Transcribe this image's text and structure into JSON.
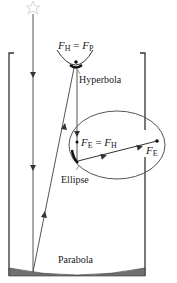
{
  "diagram": {
    "type": "Cassegrain-type telescope optical diagram",
    "labels": {
      "hyperbola_focus": {
        "base": "F",
        "sub1": "H",
        "eq": " = ",
        "base2": "F",
        "sub2": "P"
      },
      "hyperbola": "Hyperbola",
      "ellipse_focus_eq": {
        "base": "F",
        "sub1": "E",
        "eq": " = ",
        "base2": "F",
        "sub2": "H"
      },
      "ellipse_far_focus": {
        "base": "F",
        "sub": "E"
      },
      "ellipse": "Ellipse",
      "parabola": "Parabola"
    },
    "icons": {
      "star": "star-icon"
    },
    "colors": {
      "line": "#333333",
      "mirror_fill": "#707070",
      "star": "#dddddd",
      "background": "#ffffff"
    }
  }
}
